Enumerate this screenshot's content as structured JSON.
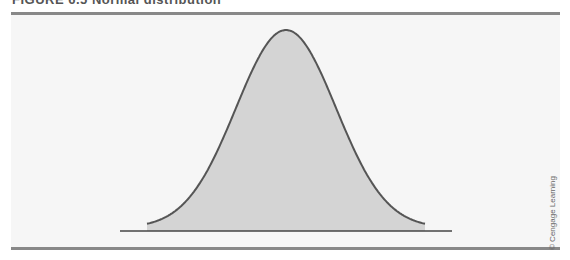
{
  "header": {
    "title": "FIGURE 6.5  Normal distribution"
  },
  "credit": "© Cengage Learning",
  "colors": {
    "fill": "#d4d4d4",
    "stroke": "#555555",
    "axis": "#444444",
    "rule": "#888888",
    "panel": "#f6f6f6"
  },
  "chart_data": {
    "type": "area",
    "title": "",
    "xlabel": "",
    "ylabel": "",
    "x": [
      -3,
      -2.5,
      -2,
      -1.5,
      -1,
      -0.5,
      0,
      0.5,
      1,
      1.5,
      2,
      2.5,
      3
    ],
    "values": [
      0.004,
      0.018,
      0.054,
      0.13,
      0.242,
      0.352,
      0.399,
      0.352,
      0.242,
      0.13,
      0.054,
      0.018,
      0.004
    ],
    "grid": false,
    "legend": null
  }
}
